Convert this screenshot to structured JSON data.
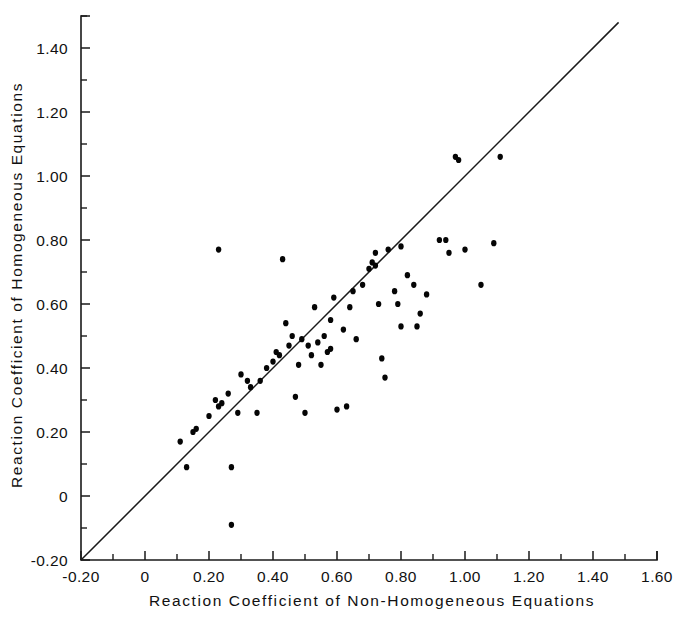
{
  "chart_data": {
    "type": "scatter",
    "title": "",
    "xlabel": "Reaction Coefficient of Non-Homogeneous Equations",
    "ylabel": "Reaction Coefficient of Homogeneous Equations",
    "xlim": [
      -0.2,
      1.6
    ],
    "ylim": [
      -0.2,
      1.5
    ],
    "grid": false,
    "legend": null,
    "x_ticklabels": [
      "-0.20",
      "0",
      "0.20",
      "0.40",
      "0.60",
      "0.80",
      "1.00",
      "1.20",
      "1.40",
      "1.60"
    ],
    "x_tickvalues": [
      -0.2,
      0,
      0.2,
      0.4,
      0.6,
      0.8,
      1.0,
      1.2,
      1.4,
      1.6
    ],
    "x_minor_step": 0.1,
    "y_ticklabels": [
      "-0.20",
      "0",
      "0.20",
      "0.40",
      "0.60",
      "0.80",
      "1.00",
      "1.20",
      "1.40"
    ],
    "y_tickvalues": [
      -0.2,
      0,
      0.2,
      0.4,
      0.6,
      0.8,
      1.0,
      1.2,
      1.4
    ],
    "y_minor_step": 0.1,
    "annotations": [
      {
        "name": "identity-line",
        "type": "line",
        "from": [
          -0.2,
          -0.2
        ],
        "to": [
          1.48,
          1.48
        ],
        "label": "y = x"
      }
    ],
    "series": [
      {
        "name": "Reaction coefficient comparison",
        "marker": "filled-circle",
        "color": "#050505",
        "points": [
          [
            0.11,
            0.17
          ],
          [
            0.13,
            0.09
          ],
          [
            0.15,
            0.2
          ],
          [
            0.16,
            0.21
          ],
          [
            0.2,
            0.25
          ],
          [
            0.22,
            0.3
          ],
          [
            0.23,
            0.28
          ],
          [
            0.24,
            0.29
          ],
          [
            0.23,
            0.77
          ],
          [
            0.26,
            0.32
          ],
          [
            0.27,
            0.09
          ],
          [
            0.27,
            -0.09
          ],
          [
            0.29,
            0.26
          ],
          [
            0.3,
            0.38
          ],
          [
            0.32,
            0.36
          ],
          [
            0.33,
            0.34
          ],
          [
            0.35,
            0.26
          ],
          [
            0.36,
            0.36
          ],
          [
            0.38,
            0.4
          ],
          [
            0.4,
            0.42
          ],
          [
            0.41,
            0.45
          ],
          [
            0.42,
            0.44
          ],
          [
            0.43,
            0.74
          ],
          [
            0.44,
            0.54
          ],
          [
            0.45,
            0.47
          ],
          [
            0.46,
            0.5
          ],
          [
            0.47,
            0.31
          ],
          [
            0.48,
            0.41
          ],
          [
            0.49,
            0.49
          ],
          [
            0.5,
            0.26
          ],
          [
            0.51,
            0.47
          ],
          [
            0.52,
            0.44
          ],
          [
            0.53,
            0.59
          ],
          [
            0.54,
            0.48
          ],
          [
            0.55,
            0.41
          ],
          [
            0.56,
            0.5
          ],
          [
            0.57,
            0.45
          ],
          [
            0.58,
            0.46
          ],
          [
            0.58,
            0.55
          ],
          [
            0.59,
            0.62
          ],
          [
            0.6,
            0.27
          ],
          [
            0.62,
            0.52
          ],
          [
            0.63,
            0.28
          ],
          [
            0.64,
            0.59
          ],
          [
            0.65,
            0.64
          ],
          [
            0.66,
            0.49
          ],
          [
            0.68,
            0.66
          ],
          [
            0.7,
            0.71
          ],
          [
            0.71,
            0.73
          ],
          [
            0.72,
            0.72
          ],
          [
            0.72,
            0.76
          ],
          [
            0.73,
            0.6
          ],
          [
            0.74,
            0.43
          ],
          [
            0.75,
            0.37
          ],
          [
            0.76,
            0.77
          ],
          [
            0.78,
            0.64
          ],
          [
            0.79,
            0.6
          ],
          [
            0.8,
            0.78
          ],
          [
            0.8,
            0.53
          ],
          [
            0.82,
            0.69
          ],
          [
            0.84,
            0.66
          ],
          [
            0.85,
            0.53
          ],
          [
            0.86,
            0.57
          ],
          [
            0.88,
            0.63
          ],
          [
            0.92,
            0.8
          ],
          [
            0.94,
            0.8
          ],
          [
            0.95,
            0.76
          ],
          [
            0.97,
            1.06
          ],
          [
            0.98,
            1.05
          ],
          [
            1.0,
            0.77
          ],
          [
            1.05,
            0.66
          ],
          [
            1.09,
            0.79
          ],
          [
            1.11,
            1.06
          ]
        ]
      }
    ]
  },
  "figure": {
    "axis_color": "#1a1a1a",
    "point_color": "#050505",
    "background": "#ffffff"
  }
}
